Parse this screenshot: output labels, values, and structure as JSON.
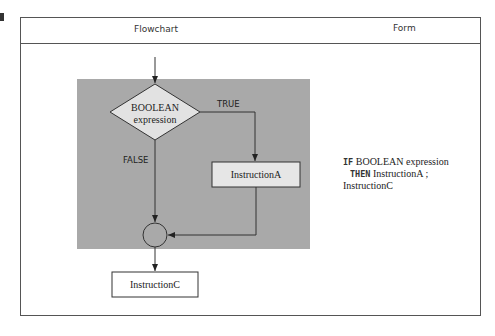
{
  "table": {
    "headers": [
      "Flowchart",
      "Form"
    ]
  },
  "flowchart": {
    "decision": {
      "line1": "BOOLEAN",
      "line2": "expression"
    },
    "true_label": "TRUE",
    "false_label": "FALSE",
    "instruction_a": "InstructionA",
    "instruction_c": "InstructionC",
    "colors": {
      "shaded_region": "#a9a9a9",
      "diamond_fill": "#e2e2e2",
      "box_fill": "#e6e6e6",
      "line": "#333333"
    }
  },
  "form": {
    "lines": [
      {
        "keyword": "IF",
        "text": "BOOLEAN expression"
      },
      {
        "keyword": "THEN",
        "text": "InstructionA ;"
      },
      {
        "keyword": "",
        "text": "InstructionC"
      }
    ]
  }
}
